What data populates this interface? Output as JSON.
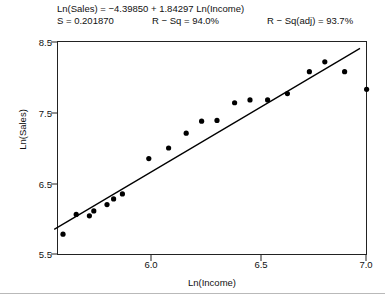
{
  "header": {
    "equation": "Ln(Sales) = −4.39850 + 1.84297 Ln(Income)",
    "s_label": "S = 0.201870",
    "rsq_label": "R − Sq = 94.0%",
    "rsq_adj_label": "R − Sq(adj) = 93.7%"
  },
  "chart_data": {
    "type": "scatter",
    "title": "Ln(Sales) = −4.39850 + 1.84297 Ln(Income)",
    "subtitle": "S = 0.201870    R − Sq = 94.0%    R − Sq(adj) = 93.7%",
    "xlabel": "Ln(Income)",
    "ylabel": "Ln(Sales)",
    "xlim": [
      5.54,
      7.0
    ],
    "ylim": [
      5.41,
      8.56
    ],
    "xticks": [
      6.0,
      6.5,
      7.0
    ],
    "xtick_labels": [
      "6.0",
      "6.5",
      "7.0"
    ],
    "yticks": [
      5.5,
      6.5,
      7.5,
      8.5
    ],
    "ytick_labels": [
      "5.5",
      "6.5",
      "7.5",
      "8.5"
    ],
    "grid": false,
    "legend": false,
    "marker": "filled-circle",
    "marker_color": "#000000",
    "points": [
      {
        "x": 5.6,
        "y": 5.78
      },
      {
        "x": 5.66,
        "y": 6.06
      },
      {
        "x": 5.72,
        "y": 6.04
      },
      {
        "x": 5.74,
        "y": 6.11
      },
      {
        "x": 5.8,
        "y": 6.2
      },
      {
        "x": 5.83,
        "y": 6.28
      },
      {
        "x": 5.87,
        "y": 6.35
      },
      {
        "x": 5.99,
        "y": 6.85
      },
      {
        "x": 6.08,
        "y": 7.0
      },
      {
        "x": 6.16,
        "y": 7.21
      },
      {
        "x": 6.23,
        "y": 7.38
      },
      {
        "x": 6.3,
        "y": 7.39
      },
      {
        "x": 6.38,
        "y": 7.64
      },
      {
        "x": 6.45,
        "y": 7.68
      },
      {
        "x": 6.53,
        "y": 7.68
      },
      {
        "x": 6.62,
        "y": 7.77
      },
      {
        "x": 6.72,
        "y": 8.08
      },
      {
        "x": 6.79,
        "y": 8.22
      },
      {
        "x": 6.88,
        "y": 8.08
      },
      {
        "x": 6.98,
        "y": 7.83
      }
    ],
    "fit_line": {
      "type": "linear-regression",
      "intercept": -4.3985,
      "slope": 1.84297,
      "x_start": 5.56,
      "x_end": 6.95,
      "color": "#000000"
    },
    "statistics": {
      "s": 0.20187,
      "r_sq_percent": 94.0,
      "r_sq_adj_percent": 93.7
    }
  },
  "axes": {
    "ytick_labels": [
      "8.5",
      "7.5",
      "6.5",
      "5.5"
    ],
    "xtick_labels": [
      "6.0",
      "6.5",
      "7.0"
    ]
  }
}
